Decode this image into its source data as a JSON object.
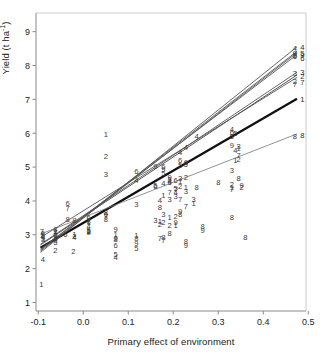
{
  "figure": {
    "kind": "scatter-with-regression-lines",
    "background": "#ffffff",
    "frame_color": "#888888"
  },
  "axes": {
    "y_label_text": "Yield (t ha",
    "y_label_sup": "-1",
    "y_label_tail": ")",
    "x_label": "Primary effect of environment",
    "y_ticks": [
      "1",
      "2",
      "3",
      "4",
      "5",
      "6",
      "7",
      "8",
      "9"
    ],
    "x_ticks": [
      "-0.1",
      "0.0",
      "0.1",
      "0.2",
      "0.3",
      "0.4",
      "0.5"
    ]
  },
  "chart_data": {
    "type": "scatter",
    "title": "",
    "xlabel": "Primary effect of environment",
    "ylabel": "Yield (t ha-1)",
    "xlim": [
      -0.105,
      0.495
    ],
    "ylim": [
      0.75,
      9.55
    ],
    "grid": false,
    "legend": "none",
    "point_marker": "digit-label",
    "note": "Each plotted symbol is the genotype number 1-9; one regression line is fitted per genotype (Finlay-Wilkinson joint regression).",
    "series": [
      {
        "name": "1",
        "label": "1",
        "color": "#555555",
        "width": 0.9,
        "line": {
          "x0": -0.095,
          "y0": 2.62,
          "x1": 0.475,
          "y1": 7.02
        },
        "points": [
          {
            "x": -0.093,
            "y": 1.55
          },
          {
            "x": -0.09,
            "y": 2.97
          },
          {
            "x": -0.062,
            "y": 3.1
          },
          {
            "x": -0.02,
            "y": 3.03
          },
          {
            "x": 0.012,
            "y": 3.38
          },
          {
            "x": 0.012,
            "y": 3.12
          },
          {
            "x": 0.05,
            "y": 5.98
          },
          {
            "x": 0.072,
            "y": 3.02
          },
          {
            "x": 0.118,
            "y": 2.98
          },
          {
            "x": 0.17,
            "y": 3.42
          },
          {
            "x": 0.178,
            "y": 4.18
          },
          {
            "x": 0.192,
            "y": 3.52
          },
          {
            "x": 0.205,
            "y": 3.3
          },
          {
            "x": 0.215,
            "y": 4.58
          },
          {
            "x": 0.228,
            "y": 4.4
          },
          {
            "x": 0.245,
            "y": 3.95
          },
          {
            "x": 0.33,
            "y": 4.4
          },
          {
            "x": 0.338,
            "y": 5.22
          },
          {
            "x": 0.345,
            "y": 5.55
          }
        ]
      },
      {
        "name": "2",
        "label": "2",
        "color": "#555555",
        "width": 0.9,
        "line": {
          "x0": -0.095,
          "y0": 2.7,
          "x1": 0.475,
          "y1": 7.72
        },
        "points": [
          {
            "x": -0.062,
            "y": 2.55
          },
          {
            "x": -0.022,
            "y": 2.52
          },
          {
            "x": -0.02,
            "y": 2.96
          },
          {
            "x": 0.012,
            "y": 3.12
          },
          {
            "x": 0.05,
            "y": 5.32
          },
          {
            "x": 0.17,
            "y": 3.32
          },
          {
            "x": 0.178,
            "y": 3.38
          },
          {
            "x": 0.192,
            "y": 3.3
          },
          {
            "x": 0.205,
            "y": 3.55
          },
          {
            "x": 0.215,
            "y": 4.45
          },
          {
            "x": 0.228,
            "y": 4.72
          },
          {
            "x": 0.33,
            "y": 4.5
          },
          {
            "x": 0.345,
            "y": 5.25
          },
          {
            "x": 0.352,
            "y": 4.42
          },
          {
            "x": 0.47,
            "y": 7.55
          }
        ]
      },
      {
        "name": "3",
        "label": "3",
        "color": "#555555",
        "width": 0.9,
        "line": {
          "x0": -0.095,
          "y0": 2.72,
          "x1": 0.475,
          "y1": 7.8
        },
        "points": [
          {
            "x": -0.09,
            "y": 2.88
          },
          {
            "x": -0.062,
            "y": 2.98
          },
          {
            "x": 0.05,
            "y": 4.8
          },
          {
            "x": 0.118,
            "y": 3.92
          },
          {
            "x": 0.16,
            "y": 3.45
          },
          {
            "x": 0.178,
            "y": 3.62
          },
          {
            "x": 0.192,
            "y": 4.05
          },
          {
            "x": 0.205,
            "y": 4.15
          },
          {
            "x": 0.215,
            "y": 4.68
          },
          {
            "x": 0.228,
            "y": 4.3
          },
          {
            "x": 0.245,
            "y": 4.05
          },
          {
            "x": 0.33,
            "y": 4.92
          },
          {
            "x": 0.345,
            "y": 5.62
          },
          {
            "x": 0.47,
            "y": 7.78
          }
        ]
      },
      {
        "name": "4",
        "label": "4",
        "color": "#555555",
        "width": 0.9,
        "line": {
          "x0": -0.095,
          "y0": 2.48,
          "x1": 0.475,
          "y1": 8.55
        },
        "points": [
          {
            "x": -0.09,
            "y": 2.28
          },
          {
            "x": -0.062,
            "y": 2.92
          },
          {
            "x": -0.02,
            "y": 2.95
          },
          {
            "x": 0.012,
            "y": 3.25
          },
          {
            "x": 0.072,
            "y": 2.35
          },
          {
            "x": 0.118,
            "y": 4.62
          },
          {
            "x": 0.17,
            "y": 4.02
          },
          {
            "x": 0.178,
            "y": 4.52
          },
          {
            "x": 0.192,
            "y": 4.58
          },
          {
            "x": 0.205,
            "y": 4.25
          },
          {
            "x": 0.215,
            "y": 5.45
          },
          {
            "x": 0.228,
            "y": 5.6
          },
          {
            "x": 0.252,
            "y": 5.92
          },
          {
            "x": 0.33,
            "y": 6.12
          },
          {
            "x": 0.338,
            "y": 5.5
          },
          {
            "x": 0.47,
            "y": 8.52
          }
        ]
      },
      {
        "name": "5",
        "label": "5",
        "color": "#555555",
        "width": 0.9,
        "line": {
          "x0": -0.095,
          "y0": 2.52,
          "x1": 0.475,
          "y1": 8.38
        },
        "points": [
          {
            "x": -0.09,
            "y": 3.0
          },
          {
            "x": -0.062,
            "y": 2.78
          },
          {
            "x": 0.012,
            "y": 3.15
          },
          {
            "x": 0.072,
            "y": 2.42
          },
          {
            "x": 0.118,
            "y": 2.62
          },
          {
            "x": 0.16,
            "y": 4.48
          },
          {
            "x": 0.178,
            "y": 4.82
          },
          {
            "x": 0.192,
            "y": 4.65
          },
          {
            "x": 0.205,
            "y": 4.38
          },
          {
            "x": 0.215,
            "y": 5.05
          },
          {
            "x": 0.228,
            "y": 5.1
          },
          {
            "x": 0.33,
            "y": 5.92
          },
          {
            "x": 0.338,
            "y": 6.02
          },
          {
            "x": 0.47,
            "y": 8.3
          }
        ]
      },
      {
        "name": "6",
        "label": "6",
        "color": "#555555",
        "width": 0.9,
        "line": {
          "x0": -0.095,
          "y0": 2.58,
          "x1": 0.475,
          "y1": 8.32
        },
        "points": [
          {
            "x": -0.09,
            "y": 3.05
          },
          {
            "x": -0.062,
            "y": 3.02
          },
          {
            "x": -0.035,
            "y": 3.95
          },
          {
            "x": -0.04,
            "y": 3.02
          },
          {
            "x": 0.012,
            "y": 3.52
          },
          {
            "x": 0.05,
            "y": 3.62
          },
          {
            "x": 0.072,
            "y": 2.7
          },
          {
            "x": 0.118,
            "y": 4.88
          },
          {
            "x": 0.16,
            "y": 4.45
          },
          {
            "x": 0.178,
            "y": 5.02
          },
          {
            "x": 0.192,
            "y": 4.55
          },
          {
            "x": 0.205,
            "y": 4.62
          },
          {
            "x": 0.215,
            "y": 5.22
          },
          {
            "x": 0.228,
            "y": 5.15
          },
          {
            "x": 0.33,
            "y": 6.05
          },
          {
            "x": 0.47,
            "y": 8.28
          }
        ]
      },
      {
        "name": "7",
        "label": "7",
        "color": "#555555",
        "width": 0.9,
        "line": {
          "x0": -0.095,
          "y0": 2.92,
          "x1": 0.475,
          "y1": 7.65
        },
        "points": [
          {
            "x": -0.092,
            "y": 3.12
          },
          {
            "x": -0.062,
            "y": 3.08
          },
          {
            "x": -0.035,
            "y": 3.78
          },
          {
            "x": 0.012,
            "y": 3.45
          },
          {
            "x": 0.05,
            "y": 3.55
          },
          {
            "x": 0.17,
            "y": 2.92
          },
          {
            "x": 0.178,
            "y": 2.85
          },
          {
            "x": 0.192,
            "y": 4.25
          },
          {
            "x": 0.205,
            "y": 4.35
          },
          {
            "x": 0.215,
            "y": 4.05
          },
          {
            "x": 0.228,
            "y": 3.85
          },
          {
            "x": 0.33,
            "y": 4.35
          },
          {
            "x": 0.345,
            "y": 5.35
          },
          {
            "x": 0.47,
            "y": 7.45
          }
        ]
      },
      {
        "name": "8",
        "label": "8",
        "color": "#777777",
        "width": 0.8,
        "line": {
          "x0": -0.095,
          "y0": 3.02,
          "x1": 0.475,
          "y1": 5.98
        },
        "points": [
          {
            "x": -0.062,
            "y": 3.18
          },
          {
            "x": -0.035,
            "y": 3.48
          },
          {
            "x": -0.02,
            "y": 3.45
          },
          {
            "x": 0.012,
            "y": 3.4
          },
          {
            "x": 0.05,
            "y": 3.68
          },
          {
            "x": 0.05,
            "y": 3.48
          },
          {
            "x": 0.072,
            "y": 2.88
          },
          {
            "x": 0.118,
            "y": 2.92
          },
          {
            "x": 0.17,
            "y": 3.82
          },
          {
            "x": 0.178,
            "y": 2.95
          },
          {
            "x": 0.192,
            "y": 3.05
          },
          {
            "x": 0.215,
            "y": 3.62
          },
          {
            "x": 0.228,
            "y": 2.82
          },
          {
            "x": 0.252,
            "y": 4.42
          },
          {
            "x": 0.265,
            "y": 3.25
          },
          {
            "x": 0.3,
            "y": 4.55
          },
          {
            "x": 0.33,
            "y": 3.52
          },
          {
            "x": 0.345,
            "y": 4.68
          },
          {
            "x": 0.36,
            "y": 2.95
          },
          {
            "x": 0.47,
            "y": 5.92
          }
        ]
      },
      {
        "name": "9",
        "label": "9",
        "color": "#555555",
        "width": 0.9,
        "line": {
          "x0": -0.095,
          "y0": 2.55,
          "x1": 0.475,
          "y1": 8.42
        },
        "points": [
          {
            "x": -0.09,
            "y": 2.92
          },
          {
            "x": -0.062,
            "y": 2.85
          },
          {
            "x": 0.012,
            "y": 3.08
          },
          {
            "x": 0.072,
            "y": 3.18
          },
          {
            "x": 0.072,
            "y": 2.92
          },
          {
            "x": 0.118,
            "y": 2.75
          },
          {
            "x": 0.16,
            "y": 5.02
          },
          {
            "x": 0.178,
            "y": 4.95
          },
          {
            "x": 0.192,
            "y": 4.72
          },
          {
            "x": 0.205,
            "y": 3.38
          },
          {
            "x": 0.215,
            "y": 3.7
          },
          {
            "x": 0.228,
            "y": 2.7
          },
          {
            "x": 0.265,
            "y": 3.15
          },
          {
            "x": 0.33,
            "y": 5.65
          },
          {
            "x": 0.352,
            "y": 4.48
          },
          {
            "x": 0.47,
            "y": 8.38
          }
        ]
      }
    ],
    "endpoint_labels": [
      {
        "label": "4",
        "x": 0.478,
        "y": 8.55
      },
      {
        "label": "5",
        "x": 0.478,
        "y": 8.38
      },
      {
        "label": "9",
        "x": 0.478,
        "y": 8.3
      },
      {
        "label": "6",
        "x": 0.478,
        "y": 8.22
      },
      {
        "label": "3",
        "x": 0.478,
        "y": 7.8
      },
      {
        "label": "2",
        "x": 0.478,
        "y": 7.68
      },
      {
        "label": "7",
        "x": 0.478,
        "y": 7.52
      },
      {
        "label": "1",
        "x": 0.478,
        "y": 7.02
      },
      {
        "label": "8",
        "x": 0.478,
        "y": 5.95
      }
    ]
  }
}
